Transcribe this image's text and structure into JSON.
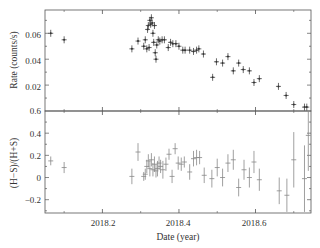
{
  "figure": {
    "xlabel": "Date (year)",
    "x_tick_labels": [
      "2018.2",
      "2018.4",
      "2018.6"
    ],
    "top_panel": {
      "ylabel": "Rate (counts/s)",
      "y_tick_labels": [
        "0.06",
        "0.04",
        "0.02"
      ]
    },
    "bottom_panel": {
      "ylabel": "(H−S)/(H+S)",
      "y_tick_labels": [
        "0.6",
        "0.4",
        "0.2",
        "0",
        "−0.2"
      ]
    }
  },
  "chart_data": [
    {
      "type": "scatter",
      "title": "",
      "xlabel": "Date (year)",
      "ylabel": "Rate (counts/s)",
      "xlim": [
        2018.05,
        2018.745
      ],
      "ylim": [
        0.0,
        0.078
      ],
      "xticks": [
        2018.2,
        2018.4,
        2018.6
      ],
      "yticks": [
        0.02,
        0.04,
        0.06
      ],
      "grid": false,
      "error_bars": true,
      "series": [
        {
          "name": "Rate",
          "x": [
            2018.065,
            2018.1,
            2018.277,
            2018.293,
            2018.308,
            2018.312,
            2018.316,
            2018.318,
            2018.32,
            2018.322,
            2018.324,
            2018.326,
            2018.328,
            2018.33,
            2018.332,
            2018.334,
            2018.336,
            2018.338,
            2018.34,
            2018.342,
            2018.346,
            2018.35,
            2018.356,
            2018.362,
            2018.372,
            2018.378,
            2018.384,
            2018.392,
            2018.4,
            2018.41,
            2018.416,
            2018.428,
            2018.438,
            2018.446,
            2018.452,
            2018.464,
            2018.488,
            2018.498,
            2018.514,
            2018.528,
            2018.542,
            2018.556,
            2018.568,
            2018.584,
            2018.596,
            2018.61,
            2018.66,
            2018.68,
            2018.7,
            2018.728,
            2018.734
          ],
          "y": [
            0.06,
            0.055,
            0.048,
            0.054,
            0.05,
            0.055,
            0.048,
            0.063,
            0.066,
            0.049,
            0.07,
            0.067,
            0.072,
            0.068,
            0.06,
            0.053,
            0.066,
            0.045,
            0.04,
            0.051,
            0.055,
            0.054,
            0.055,
            0.055,
            0.049,
            0.053,
            0.052,
            0.052,
            0.05,
            0.047,
            0.047,
            0.047,
            0.046,
            0.047,
            0.048,
            0.044,
            0.026,
            0.038,
            0.037,
            0.042,
            0.031,
            0.037,
            0.032,
            0.031,
            0.022,
            0.025,
            0.019,
            0.012,
            0.005,
            0.003,
            0.003
          ]
        }
      ]
    },
    {
      "type": "scatter",
      "title": "",
      "xlabel": "Date (year)",
      "ylabel": "(H−S)/(H+S)",
      "xlim": [
        2018.05,
        2018.745
      ],
      "ylim": [
        -0.32,
        0.6
      ],
      "xticks": [
        2018.2,
        2018.4,
        2018.6
      ],
      "yticks": [
        -0.2,
        0,
        0.2,
        0.4,
        0.6
      ],
      "grid": false,
      "error_bars": true,
      "series": [
        {
          "name": "Hardness ratio",
          "x": [
            2018.065,
            2018.1,
            2018.277,
            2018.293,
            2018.308,
            2018.312,
            2018.316,
            2018.32,
            2018.324,
            2018.328,
            2018.332,
            2018.336,
            2018.34,
            2018.344,
            2018.348,
            2018.352,
            2018.358,
            2018.366,
            2018.374,
            2018.382,
            2018.39,
            2018.398,
            2018.406,
            2018.414,
            2018.428,
            2018.438,
            2018.446,
            2018.454,
            2018.466,
            2018.486,
            2018.5,
            2018.514,
            2018.528,
            2018.542,
            2018.556,
            2018.57,
            2018.584,
            2018.596,
            2018.61,
            2018.662,
            2018.682,
            2018.7,
            2018.728,
            2018.738
          ],
          "y": [
            0.15,
            0.09,
            0.01,
            0.23,
            0.01,
            0.03,
            0.1,
            0.15,
            0.08,
            0.16,
            0.07,
            0.12,
            0.06,
            0.08,
            0.13,
            0.1,
            0.07,
            0.12,
            0.21,
            0.01,
            0.26,
            0.13,
            0.12,
            0.14,
            0.05,
            0.17,
            0.18,
            0.18,
            0.02,
            -0.01,
            0.09,
            0.0,
            0.13,
            0.16,
            -0.09,
            0.07,
            0.0,
            0.14,
            -0.02,
            -0.12,
            -0.16,
            0.16,
            -0.01,
            0.38
          ],
          "yerr": [
            0.04,
            0.05,
            0.07,
            0.08,
            0.04,
            0.05,
            0.06,
            0.06,
            0.07,
            0.06,
            0.06,
            0.07,
            0.06,
            0.07,
            0.06,
            0.06,
            0.08,
            0.06,
            0.05,
            0.06,
            0.05,
            0.06,
            0.06,
            0.05,
            0.07,
            0.07,
            0.07,
            0.06,
            0.07,
            0.08,
            0.08,
            0.08,
            0.08,
            0.09,
            0.08,
            0.09,
            0.09,
            0.1,
            0.1,
            0.12,
            0.15,
            0.25,
            0.3,
            0.32
          ]
        }
      ]
    }
  ]
}
